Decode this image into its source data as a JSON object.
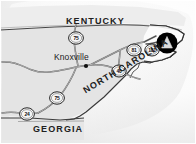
{
  "figure": {
    "type": "locator-map",
    "width_px": 196,
    "height_px": 144,
    "background_color": "#ffffff",
    "land_fill": "#e3e3e3",
    "water_fill": "#ffffff",
    "line_color": "#3a3a3a",
    "marker_color": "#000000",
    "marker_inner_color": "#dfdfdf"
  },
  "states": [
    {
      "id": "kentucky",
      "label": "KENTUCKY"
    },
    {
      "id": "north-carolina",
      "label": "NORTH CAROLINA"
    },
    {
      "id": "georgia",
      "label": "GEORGIA"
    }
  ],
  "cities": [
    {
      "id": "knoxville",
      "label": "Knoxville"
    }
  ],
  "highway_shields": [
    {
      "id": "i-75-north",
      "number": "75",
      "type": "interstate"
    },
    {
      "id": "i-81",
      "number": "81",
      "type": "interstate"
    },
    {
      "id": "i-181",
      "number": "181",
      "type": "interstate"
    },
    {
      "id": "i-40",
      "number": "40",
      "type": "interstate"
    },
    {
      "id": "i-75-south",
      "number": "75",
      "type": "interstate"
    },
    {
      "id": "i-24",
      "number": "24",
      "type": "interstate"
    }
  ],
  "markers": [
    {
      "id": "destination",
      "shape": "triangle-in-circle",
      "label": ""
    }
  ]
}
